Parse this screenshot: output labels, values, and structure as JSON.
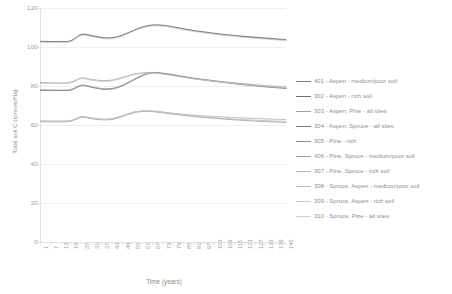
{
  "chart_data": {
    "type": "line",
    "title": "",
    "xlabel": "Time (years)",
    "ylabel": "Total soil C (tonnes/Ha)",
    "ylim": [
      0,
      120
    ],
    "yticks": [
      0,
      20,
      40,
      60,
      80,
      100,
      120
    ],
    "grid": true,
    "legend_position": "right",
    "x": [
      1,
      7,
      13,
      19,
      25,
      31,
      37,
      43,
      49,
      55,
      61,
      67,
      73,
      79,
      85,
      91,
      97,
      103,
      109,
      115,
      121,
      127,
      133,
      139,
      145
    ],
    "xticklabels": [
      "1",
      "7",
      "13",
      "19",
      "25",
      "31",
      "37",
      "43",
      "49",
      "55",
      "61",
      "67",
      "73",
      "79",
      "85",
      "91",
      "97",
      "103",
      "109",
      "115",
      "121",
      "127",
      "133",
      "139",
      "145"
    ],
    "series": [
      {
        "name": "401 - Aspen - medium/poor soil",
        "color": "#7f7f7f",
        "values": [
          103.2,
          103.1,
          103.0,
          103.6,
          106.8,
          106.2,
          105.2,
          105.0,
          106.4,
          108.6,
          110.6,
          111.6,
          111.4,
          110.6,
          109.6,
          108.7,
          108.0,
          107.3,
          106.7,
          106.2,
          105.7,
          105.3,
          104.9,
          104.5,
          104.1
        ]
      },
      {
        "name": "302 - Aspen - rich soil",
        "color": "#6e6e6e",
        "values": [
          103.0,
          102.9,
          102.9,
          103.4,
          106.5,
          105.9,
          104.9,
          104.8,
          106.2,
          108.4,
          110.4,
          111.4,
          111.2,
          110.4,
          109.4,
          108.5,
          107.8,
          107.1,
          106.5,
          106.0,
          105.4,
          105.0,
          104.6,
          104.2,
          103.8
        ]
      },
      {
        "name": "303 - Aspen, Pine - all sites",
        "color": "#a3a3a3",
        "values": [
          82.0,
          81.9,
          81.8,
          82.3,
          84.4,
          83.6,
          83.0,
          83.3,
          84.6,
          86.2,
          87.0,
          87.2,
          86.6,
          85.8,
          85.0,
          84.2,
          83.6,
          83.0,
          82.4,
          81.9,
          81.4,
          80.9,
          80.5,
          80.1,
          79.7
        ]
      },
      {
        "name": "304 - Aspen, Spruce - all sites",
        "color": "#7a7a7a",
        "values": [
          78.0,
          77.9,
          77.9,
          78.2,
          80.4,
          79.6,
          78.6,
          78.7,
          80.3,
          83.0,
          85.6,
          87.0,
          86.6,
          85.8,
          84.9,
          84.0,
          83.3,
          82.6,
          82.0,
          81.4,
          80.8,
          80.3,
          79.8,
          79.4,
          79.0
        ]
      },
      {
        "name": "305 - Pine - rich",
        "color": "#8f8f8f",
        "values": [
          78.3,
          78.2,
          78.1,
          78.5,
          80.7,
          79.9,
          78.9,
          79.0,
          80.6,
          83.3,
          85.9,
          87.2,
          86.8,
          86.0,
          85.1,
          84.2,
          83.5,
          82.8,
          82.2,
          81.6,
          81.0,
          80.5,
          80.0,
          79.6,
          79.2
        ]
      },
      {
        "name": "406 - Pine, Spruce - medium/poor soil",
        "color": "#9c9c9c",
        "values": [
          62.0,
          61.9,
          61.9,
          62.2,
          64.2,
          63.5,
          62.9,
          63.1,
          64.6,
          66.4,
          67.2,
          67.1,
          66.5,
          65.8,
          65.2,
          64.6,
          64.1,
          63.7,
          63.3,
          62.9,
          62.6,
          62.3,
          62.0,
          61.8,
          61.6
        ]
      },
      {
        "name": "307 - Pine, Spruce - rich soil",
        "color": "#b4b4b4",
        "values": [
          62.4,
          62.3,
          62.3,
          62.6,
          64.6,
          63.9,
          63.3,
          63.5,
          65.0,
          66.8,
          67.5,
          67.4,
          66.9,
          66.3,
          65.8,
          65.3,
          64.9,
          64.6,
          64.3,
          64.0,
          63.8,
          63.6,
          63.4,
          63.2,
          63.0
        ]
      },
      {
        "name": "308 - Spruce, Aspen - medium/poor soil",
        "color": "#bfbfbf",
        "values": [
          62.2,
          62.1,
          62.1,
          62.4,
          64.4,
          63.7,
          63.1,
          63.3,
          64.8,
          66.6,
          67.4,
          67.3,
          66.7,
          66.0,
          65.4,
          64.9,
          64.4,
          64.0,
          63.6,
          63.3,
          63.0,
          62.7,
          62.5,
          62.3,
          62.1
        ]
      },
      {
        "name": "309 - Spruce, Aspen - rich soil",
        "color": "#c9c9c9",
        "values": [
          81.6,
          81.5,
          81.5,
          81.9,
          84.0,
          83.2,
          82.6,
          82.9,
          84.2,
          85.9,
          86.7,
          86.9,
          86.3,
          85.5,
          84.7,
          83.9,
          83.3,
          82.7,
          82.1,
          81.6,
          81.1,
          80.6,
          80.2,
          79.8,
          79.4
        ]
      },
      {
        "name": "310 - Spruce, Pine - all sites",
        "color": "#d0d0d0",
        "values": [
          102.7,
          102.6,
          102.6,
          103.1,
          106.2,
          105.6,
          104.6,
          104.5,
          105.9,
          108.1,
          110.1,
          111.1,
          110.9,
          110.1,
          109.1,
          108.2,
          107.5,
          106.8,
          106.2,
          105.7,
          105.1,
          104.7,
          104.3,
          103.9,
          103.5
        ]
      }
    ]
  },
  "legend": {
    "items": [
      {
        "label": "401 - Aspen - medium/poor soil"
      },
      {
        "label": "302 - Aspen - rich soil"
      },
      {
        "label": "303 - Aspen, Pine - all sites"
      },
      {
        "label": "304 - Aspen, Spruce - all sites"
      },
      {
        "label": "305 - Pine - rich"
      },
      {
        "label": "406 - Pine, Spruce - medium/poor soil"
      },
      {
        "label": "307 - Pine, Spruce - rich soil"
      },
      {
        "label": "308 - Spruce, Aspen - medium/poor soil"
      },
      {
        "label": "309 - Spruce, Aspen - rich soil"
      },
      {
        "label": "310 - Spruce, Pine - all sites"
      }
    ]
  },
  "style": {
    "grid_color": "#e8e8e8",
    "axis_color": "#d9d9d9",
    "text_color": "#8f8f8f",
    "background": "#ffffff"
  }
}
